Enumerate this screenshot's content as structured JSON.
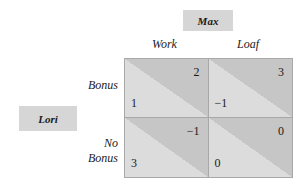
{
  "players": {
    "column": "Max",
    "row": "Lori"
  },
  "strategies": {
    "column": [
      "Work",
      "Loaf"
    ],
    "row": [
      "Bonus",
      "No Bonus"
    ]
  },
  "payoffs": [
    [
      {
        "row_player": "1",
        "column_player": "2"
      },
      {
        "row_player": "−1",
        "column_player": "3"
      }
    ],
    [
      {
        "row_player": "3",
        "column_player": "−1"
      },
      {
        "row_player": "0",
        "column_player": "0"
      }
    ]
  ],
  "colors": {
    "label_box": "#d6d6d6",
    "cell_dark": "#c6c6c6",
    "cell_light": "#dcdcdc",
    "border": "#a8a8a8"
  }
}
